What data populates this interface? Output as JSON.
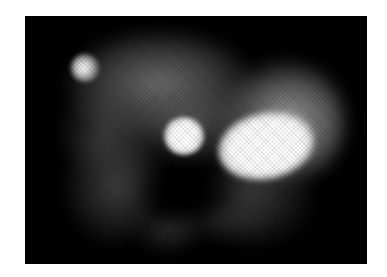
{
  "image": {
    "kind": "grayscale fluorescence-style micrograph",
    "frame": {
      "left": 25,
      "top": 16,
      "width": 342,
      "height": 248,
      "background": "#000000"
    },
    "page_background": "#ffffff",
    "regions": [
      {
        "name": "upper-haze",
        "cx": 160,
        "cy": 85,
        "rx": 95,
        "ry": 55,
        "intensity": 0.32
      },
      {
        "name": "right-lobe-halo",
        "cx": 285,
        "cy": 120,
        "rx": 60,
        "ry": 60,
        "intensity": 0.45
      },
      {
        "name": "left-lower-glow",
        "cx": 110,
        "cy": 180,
        "rx": 45,
        "ry": 55,
        "intensity": 0.22
      },
      {
        "name": "bottom-faint-patch",
        "cx": 165,
        "cy": 228,
        "rx": 30,
        "ry": 22,
        "intensity": 0.15
      },
      {
        "name": "lower-right-haze",
        "cx": 255,
        "cy": 200,
        "rx": 55,
        "ry": 45,
        "intensity": 0.22
      },
      {
        "name": "small-spot-top-left",
        "cx": 85,
        "cy": 68,
        "r": 12,
        "intensity": 0.85
      },
      {
        "name": "middle-bright-spot",
        "cx": 184,
        "cy": 135,
        "r": 16,
        "intensity": 1.0
      },
      {
        "name": "large-bright-blob",
        "cx": 264,
        "cy": 142,
        "rx": 38,
        "ry": 26,
        "intensity": 1.0
      }
    ]
  }
}
